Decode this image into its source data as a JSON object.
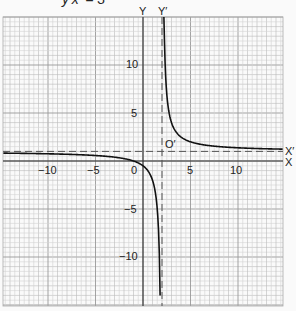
{
  "title": "y′x′ = 3",
  "chart_data": {
    "type": "line",
    "title": "y′x′ = 3",
    "equation": "(y - 1)(x - 2) = 3",
    "xlabel": "X",
    "ylabel": "Y",
    "shifted_axes": {
      "x_label": "X′",
      "y_label": "Y′",
      "origin_label": "O′",
      "x_asymptote": 2,
      "y_asymptote": 1
    },
    "origin_label": "0",
    "xlim": [
      -14.7,
      14.7
    ],
    "ylim": [
      -15,
      15
    ],
    "x_ticks": [
      -10,
      -5,
      0,
      5,
      10
    ],
    "y_ticks": [
      10,
      5,
      -5,
      -10
    ],
    "grid": true,
    "series": [
      {
        "name": "right branch",
        "x": [
          2.2,
          2.5,
          3,
          4,
          5,
          6,
          8,
          10,
          12,
          14.7
        ],
        "y": [
          16,
          7,
          4,
          2.5,
          2,
          1.75,
          1.5,
          1.375,
          1.3,
          1.24
        ]
      },
      {
        "name": "left branch",
        "x": [
          -14.7,
          -10,
          -5,
          -3,
          -1,
          0,
          1,
          1.5,
          1.8
        ],
        "y": [
          0.82,
          0.75,
          0.57,
          0.4,
          0,
          -0.5,
          -2,
          -5,
          -14
        ]
      }
    ]
  },
  "labels": {
    "y_axis": "Y",
    "y_axis_shifted": "Y′",
    "x_axis": "X",
    "x_axis_shifted": "X′",
    "origin_shifted": "O′",
    "origin": "0",
    "tick_x_neg10": "−10",
    "tick_x_neg5": "−5",
    "tick_x_5": "5",
    "tick_x_10": "10",
    "tick_y_10": "10",
    "tick_y_5": "5",
    "tick_y_neg5": "−5",
    "tick_y_neg10": "−10"
  }
}
